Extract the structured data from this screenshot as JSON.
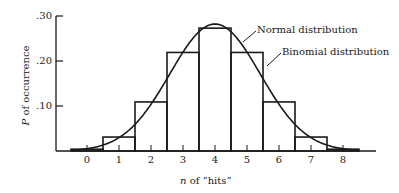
{
  "chart_data": {
    "type": "bar",
    "title": "",
    "xlabel": "n of “hits”",
    "ylabel": "P of occurrence",
    "categories": [
      "0",
      "1",
      "2",
      "3",
      "4",
      "5",
      "6",
      "7",
      "8"
    ],
    "series": [
      {
        "name": "Binomial distribution",
        "type": "bar",
        "values": [
          0.004,
          0.031,
          0.109,
          0.219,
          0.273,
          0.219,
          0.109,
          0.031,
          0.004
        ]
      },
      {
        "name": "Normal distribution",
        "type": "line",
        "values": [
          0.009,
          0.034,
          0.104,
          0.208,
          0.282,
          0.208,
          0.104,
          0.034,
          0.009
        ]
      }
    ],
    "yticks": [
      ".10",
      ".20",
      ".30"
    ],
    "ylim": [
      0,
      0.3
    ],
    "grid": false,
    "annotations": [
      "Normal distribution",
      "Binomial distribution"
    ]
  },
  "labels": {
    "ylabel_var": "P",
    "ylabel_rest": " of occurrence",
    "xlabel_var": "n",
    "xlabel_rest": " of “hits”",
    "normal": "Normal distribution",
    "binomial": "Binomial distribution"
  }
}
